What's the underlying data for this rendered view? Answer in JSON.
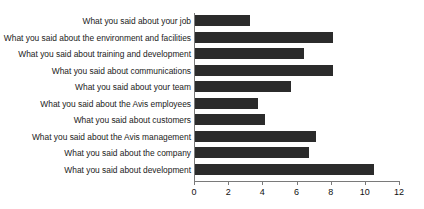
{
  "chart_data": {
    "type": "bar",
    "orientation": "horizontal",
    "title": "",
    "subtitle": "",
    "xlabel": "",
    "ylabel": "",
    "xlim": [
      0,
      12
    ],
    "xticks": [
      0,
      2,
      4,
      6,
      8,
      10,
      12
    ],
    "xtick_labels": [
      "0",
      "2",
      "4",
      "6",
      "8",
      "10",
      "12"
    ],
    "grid": false,
    "legend": false,
    "legend_position": "none",
    "bar_color": "#2b2b2b",
    "axis_color": "#7a7a7a",
    "background_color": "#ffffff",
    "categories": [
      "What you said about your job",
      "What you said about the environment and facilities",
      "What you said about training and development",
      "What you said about communications",
      "What you said about your team",
      "What you said about the Avis employees",
      "What you said about customers",
      "What you said about the Avis management",
      "What you said about the company",
      "What you said about development"
    ],
    "values": [
      3.2,
      8.1,
      6.4,
      8.1,
      5.6,
      3.7,
      4.1,
      7.1,
      6.7,
      10.5
    ]
  }
}
